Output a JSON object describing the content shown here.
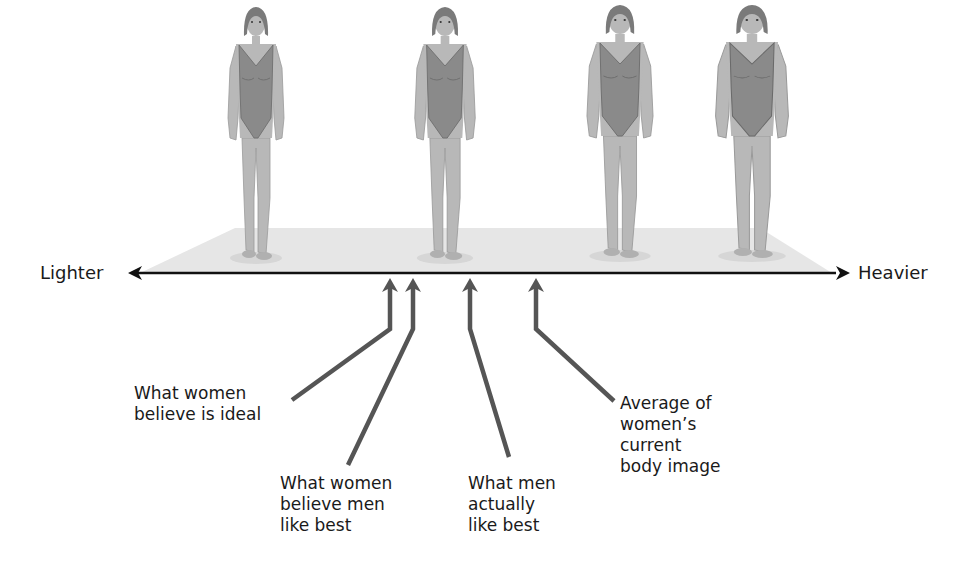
{
  "axis": {
    "left_label": "Lighter",
    "right_label": "Heavier",
    "left_arrow_icon": "arrowhead-left-icon",
    "right_arrow_icon": "arrowhead-right-icon"
  },
  "figures": [
    {
      "position": "thinnest",
      "icon": "woman-figure-icon"
    },
    {
      "position": "slender",
      "icon": "woman-figure-icon"
    },
    {
      "position": "moderate",
      "icon": "woman-figure-icon"
    },
    {
      "position": "heaviest",
      "icon": "woman-figure-icon"
    }
  ],
  "callouts": [
    {
      "label": "What women\nbelieve is ideal",
      "icon": "up-arrow-icon"
    },
    {
      "label": "What women\nbelieve men\nlike best",
      "icon": "up-arrow-icon"
    },
    {
      "label": "What men\nactually\nlike best",
      "icon": "up-arrow-icon"
    },
    {
      "label": "Average of\nwomen’s\ncurrent\nbody image",
      "icon": "up-arrow-icon"
    }
  ],
  "colors": {
    "background": "#ffffff",
    "platform": "#e6e6e6",
    "axis_line": "#111111",
    "callout_arrow": "#555555",
    "skin": "#b8b8b8",
    "swimsuit": "#8a8a8a",
    "hair": "#7a7a7a",
    "text": "#1a1a1a"
  }
}
